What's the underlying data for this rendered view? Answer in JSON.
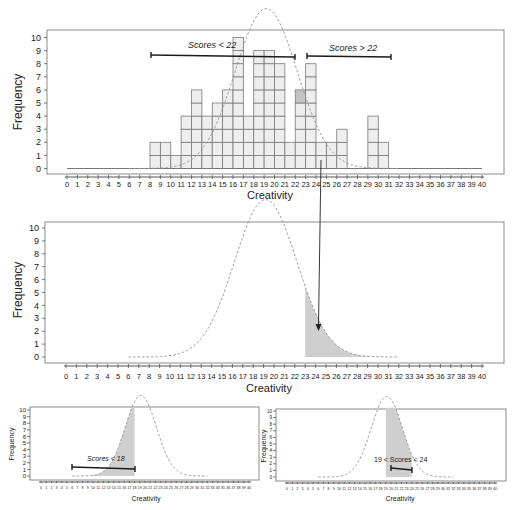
{
  "chart_data": [
    {
      "id": "histogram",
      "type": "bar",
      "title": "",
      "xlabel": "Creativity",
      "ylabel": "Frequency",
      "x_ticks": [
        0,
        1,
        2,
        3,
        4,
        5,
        6,
        7,
        8,
        9,
        10,
        11,
        12,
        13,
        14,
        15,
        16,
        17,
        18,
        19,
        20,
        21,
        22,
        23,
        24,
        25,
        26,
        27,
        28,
        29,
        30,
        31,
        32,
        33,
        34,
        35,
        36,
        37,
        38,
        39,
        40
      ],
      "y_ticks": [
        0,
        1,
        2,
        3,
        4,
        5,
        6,
        7,
        8,
        9,
        10
      ],
      "xlim": [
        0,
        40
      ],
      "ylim": [
        0,
        10
      ],
      "categories": [
        8,
        9,
        10,
        11,
        12,
        13,
        14,
        15,
        16,
        17,
        18,
        19,
        20,
        21,
        22,
        23,
        24,
        25,
        26,
        27,
        28,
        29,
        30
      ],
      "values": [
        2,
        2,
        1,
        4,
        6,
        4,
        5,
        6,
        10,
        4,
        9,
        9,
        8,
        2,
        6,
        8,
        2,
        2,
        3,
        0,
        0,
        4,
        2
      ],
      "highlighted_cell": {
        "bin": 22,
        "level": 6
      },
      "overlay": {
        "type": "normal-curve",
        "mean": 19.2,
        "sd": 3.0,
        "peak": 12.2,
        "range": [
          6,
          32
        ],
        "style": "dashed"
      },
      "annotations": [
        {
          "label": "Scores < 22",
          "from": 8,
          "to": 22,
          "y": 8.6
        },
        {
          "label": "Scores > 22",
          "from": 23,
          "to": 31,
          "y": 8.5
        }
      ],
      "grid": false
    },
    {
      "id": "tail-area",
      "type": "area",
      "xlabel": "Creativity",
      "ylabel": "Frequency",
      "x_ticks": [
        0,
        1,
        2,
        3,
        4,
        5,
        6,
        7,
        8,
        9,
        10,
        11,
        12,
        13,
        14,
        15,
        16,
        17,
        18,
        19,
        20,
        21,
        22,
        23,
        24,
        25,
        26,
        27,
        28,
        29,
        30,
        31,
        32,
        33,
        34,
        35,
        36,
        37,
        38,
        39,
        40
      ],
      "y_ticks": [
        0,
        1,
        2,
        3,
        4,
        5,
        6,
        7,
        8,
        9,
        10
      ],
      "xlim": [
        0,
        40
      ],
      "ylim": [
        0,
        10
      ],
      "overlay": {
        "type": "normal-curve",
        "mean": 19.2,
        "sd": 3.0,
        "peak": 12.2,
        "range": [
          6,
          32
        ],
        "style": "dashed"
      },
      "shaded_region": {
        "from": 23,
        "to": 32,
        "description": "Scores > 22"
      },
      "annotations": [
        {
          "type": "arrow",
          "from_chart": "histogram",
          "points_to": 24.4
        }
      ]
    },
    {
      "id": "lower-tail",
      "type": "area",
      "xlabel": "Creativity",
      "ylabel": "Frequency",
      "x_ticks": [
        0,
        1,
        2,
        3,
        4,
        5,
        6,
        7,
        8,
        9,
        10,
        11,
        12,
        13,
        14,
        15,
        16,
        17,
        18,
        19,
        20,
        21,
        22,
        23,
        24,
        25,
        26,
        27,
        28,
        29,
        30,
        31,
        32,
        33,
        34,
        35,
        36,
        37,
        38,
        39,
        40
      ],
      "y_ticks": [
        0,
        1,
        2,
        3,
        4,
        5,
        6,
        7,
        8,
        9,
        10
      ],
      "xlim": [
        0,
        40
      ],
      "ylim": [
        0,
        10
      ],
      "overlay": {
        "type": "normal-curve",
        "mean": 19.2,
        "sd": 3.0,
        "peak": 12.2,
        "range": [
          6,
          32
        ],
        "style": "dashed"
      },
      "shaded_region": {
        "from": 6,
        "to": 18
      },
      "annotations": [
        {
          "label": "Scores < 18",
          "from": 6,
          "to": 18,
          "y": 1.3
        }
      ]
    },
    {
      "id": "middle-band",
      "type": "area",
      "xlabel": "Creativity",
      "ylabel": "Frequency",
      "x_ticks": [
        0,
        1,
        2,
        3,
        4,
        5,
        6,
        7,
        8,
        9,
        10,
        11,
        12,
        13,
        14,
        15,
        16,
        17,
        18,
        19,
        20,
        21,
        22,
        23,
        24,
        25,
        26,
        27,
        28,
        29,
        30,
        31,
        32,
        33,
        34,
        35,
        36,
        37,
        38,
        39,
        40
      ],
      "y_ticks": [
        0,
        1,
        2,
        3,
        4,
        5,
        6,
        7,
        8,
        9,
        10
      ],
      "xlim": [
        0,
        40
      ],
      "ylim": [
        0,
        10
      ],
      "overlay": {
        "type": "normal-curve",
        "mean": 19.2,
        "sd": 3.0,
        "peak": 12.2,
        "range": [
          6,
          32
        ],
        "style": "dashed"
      },
      "shaded_region": {
        "from": 19,
        "to": 24
      },
      "annotations": [
        {
          "label": "19 < Scores < 24",
          "from": 19,
          "to": 24,
          "y": 1.3
        }
      ]
    }
  ],
  "labels": {
    "xlabel": "Creativity",
    "ylabel": "Frequency",
    "bracket_low": "Scores < 22",
    "bracket_high": "Scores > 22",
    "bracket_bl": "Scores < 18",
    "bracket_br": "19 < Scores < 24"
  },
  "colors": {
    "bar_fill": "#eeeeee",
    "bar_stroke": "#7a7a7a",
    "highlight_cell": "#c4c4c4",
    "shade": "#cfcfcf",
    "curve": "#9a9a9a",
    "bracket": "#1a1a1a"
  }
}
